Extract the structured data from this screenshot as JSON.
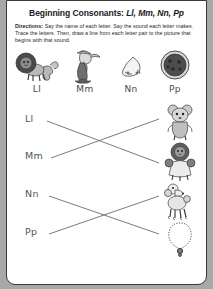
{
  "page": {
    "title_prefix": "Beginning Consonants: ",
    "title_letters": "Ll, Mm, Nn, Pp",
    "directions_lead": "Directions:",
    "directions_text": " Say the name of each letter. Say the sound each letter makes. Trace the letters. Then, draw a line from each letter pair to the picture that begins with that sound.",
    "paper_color": "#ffffff",
    "background_color": "#a8a8a8",
    "ink_color": "#555555"
  },
  "reference_row": [
    {
      "label": "Ll",
      "picture": "lion-picture",
      "x": 10
    },
    {
      "label": "Mm",
      "picture": "mermaid-picture",
      "x": 58
    },
    {
      "label": "Nn",
      "picture": "nose-picture",
      "x": 104
    },
    {
      "label": "Pp",
      "picture": "pizza-picture",
      "x": 148
    }
  ],
  "left_column": [
    {
      "label": "Ll",
      "x": 18,
      "y": 18
    },
    {
      "label": "Mm",
      "x": 18,
      "y": 55
    },
    {
      "label": "Nn",
      "x": 18,
      "y": 93
    },
    {
      "label": "Pp",
      "x": 18,
      "y": 131
    }
  ],
  "right_column": [
    {
      "picture": "mouse-picture",
      "x": 152,
      "y": 4
    },
    {
      "picture": "lion-toy-picture",
      "x": 152,
      "y": 44
    },
    {
      "picture": "poodle-picture",
      "x": 152,
      "y": 84
    },
    {
      "picture": "necklace-picture",
      "x": 152,
      "y": 122
    }
  ],
  "connections": [
    {
      "name": "line-ll-to-lion",
      "from": "Ll",
      "to": "lion-toy-picture",
      "x1": 40,
      "y1": 20,
      "x2": 152,
      "y2": 62
    },
    {
      "name": "line-mm-to-mouse",
      "from": "Mm",
      "to": "mouse-picture",
      "x1": 44,
      "y1": 57,
      "x2": 152,
      "y2": 18
    },
    {
      "name": "line-nn-to-necklace",
      "from": "Nn",
      "to": "necklace-picture",
      "x1": 42,
      "y1": 95,
      "x2": 152,
      "y2": 133
    },
    {
      "name": "line-pp-to-poodle",
      "from": "Pp",
      "to": "poodle-picture",
      "x1": 42,
      "y1": 133,
      "x2": 152,
      "y2": 95
    }
  ]
}
